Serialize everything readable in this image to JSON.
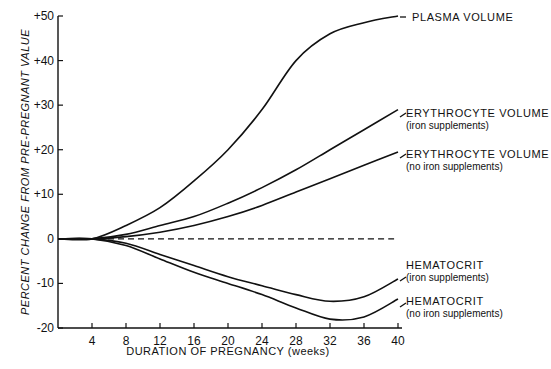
{
  "chart_data": {
    "type": "line",
    "title": "",
    "xlabel": "DURATION OF PREGNANCY (weeks)",
    "ylabel": "PERCENT CHANGE FROM PRE-PREGNANT VALUE",
    "xlim": [
      0,
      40
    ],
    "ylim": [
      -20,
      50
    ],
    "xticks": [
      4,
      8,
      12,
      16,
      20,
      24,
      28,
      32,
      36,
      40
    ],
    "xtick_labels": [
      "4",
      "8",
      "12",
      "16",
      "20",
      "24",
      "28",
      "32",
      "36",
      "40"
    ],
    "yticks": [
      -20,
      -10,
      0,
      10,
      20,
      30,
      40,
      50
    ],
    "ytick_labels": [
      "-20",
      "-10",
      "0",
      "+10",
      "+20",
      "+30",
      "+40",
      "+50"
    ],
    "grid": false,
    "legend_position": "right, inline labels at line ends",
    "x": [
      0,
      4,
      8,
      12,
      16,
      20,
      24,
      28,
      32,
      36,
      40
    ],
    "series": [
      {
        "name": "PLASMA VOLUME",
        "sub": "",
        "style": "solid",
        "values": [
          0,
          0,
          3,
          7,
          13,
          20,
          29,
          40,
          46,
          48.5,
          50
        ]
      },
      {
        "name": "ERYTHROCYTE VOLUME",
        "sub": "(iron supplements)",
        "style": "solid",
        "values": [
          0,
          0,
          1,
          3,
          5,
          8,
          11.5,
          15.5,
          20,
          24.5,
          29
        ]
      },
      {
        "name": "ERYTHROCYTE VOLUME",
        "sub": "(no iron supplements)",
        "style": "solid",
        "values": [
          0,
          0,
          0.5,
          1.5,
          3,
          5,
          7.5,
          10.5,
          13.5,
          16.5,
          19.5
        ]
      },
      {
        "name": "Baseline (pre-pregnant)",
        "sub": "",
        "style": "dashed",
        "values": [
          0,
          0,
          0,
          0,
          0,
          0,
          0,
          0,
          0,
          0,
          0
        ]
      },
      {
        "name": "HEMATOCRIT",
        "sub": "(iron supplements)",
        "style": "solid",
        "values": [
          0,
          0,
          -1,
          -3.5,
          -6,
          -8.5,
          -10.5,
          -12.5,
          -14,
          -13,
          -9
        ]
      },
      {
        "name": "HEMATOCRIT",
        "sub": "(no iron supplements)",
        "style": "solid",
        "values": [
          0,
          0,
          -1.5,
          -4.5,
          -7.5,
          -10,
          -12.5,
          -15.5,
          -18,
          -17.5,
          -13.5
        ]
      }
    ]
  },
  "labels": {
    "plasma": "PLASMA VOLUME",
    "ery_iron": "ERYTHROCYTE VOLUME",
    "ery_iron_sub": "(iron supplements)",
    "ery_noiron": "ERYTHROCYTE VOLUME",
    "ery_noiron_sub": "(no iron supplements)",
    "hct_iron": "HEMATOCRIT",
    "hct_iron_sub": "(iron supplements)",
    "hct_noiron": "HEMATOCRIT",
    "hct_noiron_sub": "(no iron supplements)"
  }
}
